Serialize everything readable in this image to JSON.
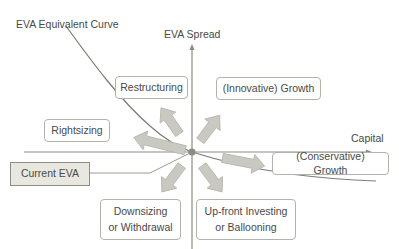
{
  "diagram": {
    "title_semantics": "EVA Spread vs Capital strategy quadrant diagram",
    "axes": {
      "y_label": "EVA Spread",
      "x_label": "Capital"
    },
    "curve": {
      "label": "EVA Equivalent Curve"
    },
    "origin_marker": {
      "label": "Current EVA"
    },
    "quadrant_boxes": [
      {
        "id": "restructuring",
        "label": "Restructuring"
      },
      {
        "id": "innovative-growth",
        "label": "(Innovative) Growth"
      },
      {
        "id": "rightsizing",
        "label": "Rightsizing"
      },
      {
        "id": "conservative-growth",
        "label": "(Conservative) Growth"
      },
      {
        "id": "downsizing",
        "label": "Downsizing\nor Withdrawal"
      },
      {
        "id": "upfront-investing",
        "label": "Up-front Investing\nor Ballooning"
      }
    ],
    "arrows": [
      {
        "id": "arrow-up-left",
        "direction": "up-left",
        "points_to": "restructuring"
      },
      {
        "id": "arrow-up-right",
        "direction": "up-right",
        "points_to": "innovative-growth"
      },
      {
        "id": "arrow-left",
        "direction": "left",
        "points_to": "rightsizing"
      },
      {
        "id": "arrow-right",
        "direction": "right",
        "points_to": "conservative-growth"
      },
      {
        "id": "arrow-down-left",
        "direction": "down-left",
        "points_to": "downsizing"
      },
      {
        "id": "arrow-down-right",
        "direction": "down-right",
        "points_to": "upfront-investing"
      }
    ],
    "colors": {
      "axis": "#8c8c84",
      "curve": "#7d7d75",
      "arrow_fill": "#c9c9c1",
      "arrow_stroke": "#b4b4ac",
      "box_border": "#b2b2ac",
      "text": "#4a4a46",
      "current_eva_fill": "#e8e8e0"
    }
  }
}
